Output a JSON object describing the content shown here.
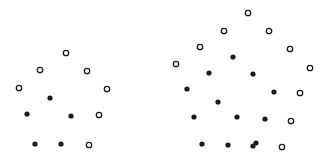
{
  "figure": {
    "title": "",
    "background_color": "#ffffff",
    "width": 330,
    "height": 159
  },
  "markers": {
    "filled": {
      "label": "filled-dot",
      "fill_color": "#1a1a1a",
      "stroke_color": "#1a1a1a",
      "radius": 2.6,
      "stroke_width": 0
    },
    "open": {
      "label": "open-circle",
      "fill_color": "#ffffff",
      "stroke_color": "#1a1a1a",
      "radius": 2.7,
      "stroke_width": 1.3
    }
  },
  "chart_data": {
    "type": "scatter",
    "title": "",
    "subtitle": "",
    "xlabel": "",
    "ylabel": "",
    "xlim": [
      0,
      330
    ],
    "ylim": [
      0,
      159
    ],
    "grid": false,
    "axes_visible": false,
    "tick_labels": {
      "x": [],
      "y": []
    },
    "legend": {
      "visible": false,
      "position": "none",
      "entries": [
        {
          "name": "Open circles",
          "marker": "open"
        },
        {
          "name": "Filled dots",
          "marker": "filled"
        }
      ]
    },
    "annotations": [],
    "groups": [
      {
        "name": "Left cluster",
        "series": [
          {
            "name": "open",
            "marker": "open",
            "points": [
              [
                66,
                53
              ],
              [
                40,
                70
              ],
              [
                87,
                71
              ],
              [
                19,
                88
              ],
              [
                107,
                89
              ],
              [
                99,
                115
              ],
              [
                89,
                145
              ]
            ]
          },
          {
            "name": "filled",
            "marker": "filled",
            "points": [
              [
                50,
                98
              ],
              [
                27,
                114
              ],
              [
                71,
                116
              ],
              [
                35,
                144
              ],
              [
                61,
                144
              ]
            ]
          }
        ]
      },
      {
        "name": "Right cluster",
        "series": [
          {
            "name": "open",
            "marker": "open",
            "points": [
              [
                248,
                13
              ],
              [
                224,
                31
              ],
              [
                269,
                31
              ],
              [
                200,
                47
              ],
              [
                290,
                49
              ],
              [
                176,
                64
              ],
              [
                310,
                68
              ],
              [
                300,
                93
              ],
              [
                291,
                121
              ],
              [
                282,
                147
              ]
            ]
          },
          {
            "name": "filled",
            "marker": "filled",
            "points": [
              [
                233,
                57
              ],
              [
                209,
                73
              ],
              [
                253,
                74
              ],
              [
                187,
                89
              ],
              [
                274,
                92
              ],
              [
                218,
                102
              ],
              [
                194,
                117
              ],
              [
                237,
                117
              ],
              [
                265,
                119
              ],
              [
                202,
                144
              ],
              [
                228,
                145
              ],
              [
                253,
                146
              ],
              [
                256,
                143
              ]
            ]
          }
        ]
      }
    ]
  }
}
